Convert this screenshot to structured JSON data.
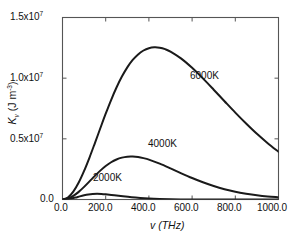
{
  "chart_data": {
    "type": "line",
    "title": "",
    "xlabel": "v (THz)",
    "ylabel": "K_v (J m^-3)",
    "xlim": [
      0,
      1000
    ],
    "ylim": [
      0,
      15000000
    ],
    "grid": false,
    "legend_position": "inline-annotations",
    "x_tick_labels": [
      "0.0",
      "200.0",
      "400.0",
      "600.0",
      "800.0",
      "1000.0"
    ],
    "x_tick_values": [
      0,
      200,
      400,
      600,
      800,
      1000
    ],
    "y_tick_labels": [
      "0.0",
      "0.5x10^7",
      "1.0x10^7",
      "1.5x10^7"
    ],
    "y_tick_values": [
      0,
      5000000,
      10000000,
      15000000
    ],
    "series": [
      {
        "name": "6000K",
        "temperature_K": 6000,
        "color": "#1a1a1a",
        "peak_x": 352,
        "peak_y": 12700000,
        "x": [
          0,
          25,
          50,
          75,
          100,
          125,
          150,
          175,
          200,
          225,
          250,
          275,
          300,
          325,
          350,
          375,
          400,
          425,
          450,
          475,
          500,
          550,
          600,
          650,
          700,
          750,
          800,
          850,
          900,
          950,
          1000
        ],
        "y": [
          0,
          170000,
          650000,
          1400000,
          2360000,
          3460000,
          4650000,
          5870000,
          7070000,
          8200000,
          9230000,
          10130000,
          10890000,
          11500000,
          11960000,
          12280000,
          12470000,
          12540000,
          12510000,
          12390000,
          12190000,
          11610000,
          10850000,
          9980000,
          9050000,
          8100000,
          7160000,
          6260000,
          5410000,
          4640000,
          3930000
        ]
      },
      {
        "name": "4000K",
        "temperature_K": 4000,
        "color": "#1a1a1a",
        "peak_x": 235,
        "peak_y": 3760000,
        "x": [
          0,
          25,
          50,
          75,
          100,
          125,
          150,
          175,
          200,
          225,
          250,
          275,
          300,
          325,
          350,
          375,
          400,
          450,
          500,
          550,
          600,
          650,
          700,
          750,
          800,
          850,
          900,
          950,
          1000
        ],
        "y": [
          0,
          80000,
          300000,
          630000,
          1040000,
          1490000,
          1950000,
          2380000,
          2760000,
          3070000,
          3300000,
          3450000,
          3530000,
          3540000,
          3500000,
          3410000,
          3290000,
          2960000,
          2570000,
          2160000,
          1770000,
          1420000,
          1110000,
          850000,
          640000,
          480000,
          350000,
          250000,
          180000
        ]
      },
      {
        "name": "2000K",
        "temperature_K": 2000,
        "color": "#1a1a1a",
        "peak_x": 118,
        "peak_y": 470000,
        "x": [
          0,
          20,
          40,
          60,
          80,
          100,
          120,
          140,
          160,
          180,
          200,
          240,
          280,
          320,
          360,
          400,
          450,
          500,
          550,
          600,
          700,
          800,
          900,
          1000
        ],
        "y": [
          0,
          20000,
          80000,
          160000,
          260000,
          350000,
          420000,
          460000,
          470000,
          460000,
          430000,
          350000,
          260000,
          180000,
          120000,
          75000,
          38000,
          18000,
          8000,
          3500,
          600,
          90,
          12,
          2
        ]
      }
    ],
    "annotations": [
      {
        "text": "6000K",
        "x": 560,
        "y": 9500000
      },
      {
        "text": "4000K",
        "x": 330,
        "y": 2200000
      },
      {
        "text": "2000K",
        "x": 160,
        "y": 1150000
      }
    ]
  },
  "axes": {
    "y_ticks": [
      {
        "label_mantissa": "1.5x10",
        "label_exp": "7"
      },
      {
        "label_mantissa": "1.0x10",
        "label_exp": "7"
      },
      {
        "label_mantissa": "0.5x10",
        "label_exp": "7"
      },
      {
        "label_mantissa": "0.0",
        "label_exp": ""
      }
    ],
    "x_ticks": [
      "0.0",
      "200.0",
      "400.0",
      "600.0",
      "800.0",
      "1000.0"
    ],
    "y_title": {
      "symbol": "K",
      "subscript": "v",
      "unit_open": " (J m",
      "unit_exp": "-3",
      "unit_close": ")"
    },
    "x_title": "v (THz)"
  },
  "curve_labels": {
    "hot": "6000K",
    "mid": "4000K",
    "cool": "2000K"
  }
}
